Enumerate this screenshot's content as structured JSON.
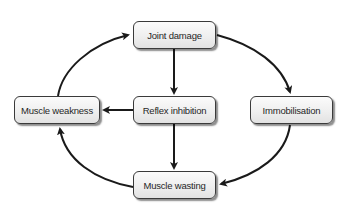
{
  "diagram": {
    "type": "cycle-flowchart",
    "nodes": [
      {
        "id": "joint_damage",
        "label": "Joint damage"
      },
      {
        "id": "muscle_weakness",
        "label": "Muscle weakness"
      },
      {
        "id": "reflex_inhibition",
        "label": "Reflex inhibition"
      },
      {
        "id": "immobilisation",
        "label": "Immobilisation"
      },
      {
        "id": "muscle_wasting",
        "label": "Muscle wasting"
      }
    ],
    "edges": [
      {
        "from": "joint_damage",
        "to": "reflex_inhibition",
        "style": "straight"
      },
      {
        "from": "joint_damage",
        "to": "immobilisation",
        "style": "curved"
      },
      {
        "from": "reflex_inhibition",
        "to": "muscle_weakness",
        "style": "straight"
      },
      {
        "from": "reflex_inhibition",
        "to": "muscle_wasting",
        "style": "straight"
      },
      {
        "from": "immobilisation",
        "to": "muscle_wasting",
        "style": "curved"
      },
      {
        "from": "muscle_wasting",
        "to": "muscle_weakness",
        "style": "curved"
      },
      {
        "from": "muscle_weakness",
        "to": "joint_damage",
        "style": "curved"
      }
    ],
    "colors": {
      "arrow": "#1a1a1a",
      "node_border": "#3a3a3a",
      "node_text": "#262626",
      "background": "#ffffff"
    }
  }
}
